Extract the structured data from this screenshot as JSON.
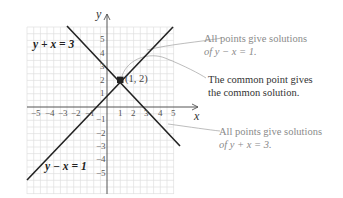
{
  "diagram": {
    "axes": {
      "x_label": "x",
      "y_label": "y",
      "x_ticks": [
        "−5",
        "−4",
        "−3",
        "−2",
        "−1",
        "1",
        "2",
        "3",
        "4",
        "5"
      ],
      "y_ticks_pos": [
        "1",
        "2",
        "3",
        "4",
        "5"
      ],
      "y_ticks_neg": [
        "−1",
        "−2",
        "−3",
        "−4",
        "−5"
      ]
    },
    "lines": [
      {
        "equation": "y + x = 3",
        "color": "#222222"
      },
      {
        "equation": "y − x = 1",
        "color": "#222222"
      }
    ],
    "intersection": {
      "label": "(1, 2)",
      "x": 1,
      "y": 2
    },
    "annotations": [
      {
        "line1": "All points give solutions",
        "line2": "of y − x = 1.",
        "color": "#8a8a8a"
      },
      {
        "line1": "The common point gives",
        "line2": "the common solution.",
        "color": "#333333"
      },
      {
        "line1": "All points give solutions",
        "line2": "of y + x = 3.",
        "color": "#8a8a8a"
      }
    ],
    "colors": {
      "grid": "#dcdcdc",
      "axis": "#555555",
      "line": "#222222",
      "leader": "#9a9a9a"
    }
  }
}
